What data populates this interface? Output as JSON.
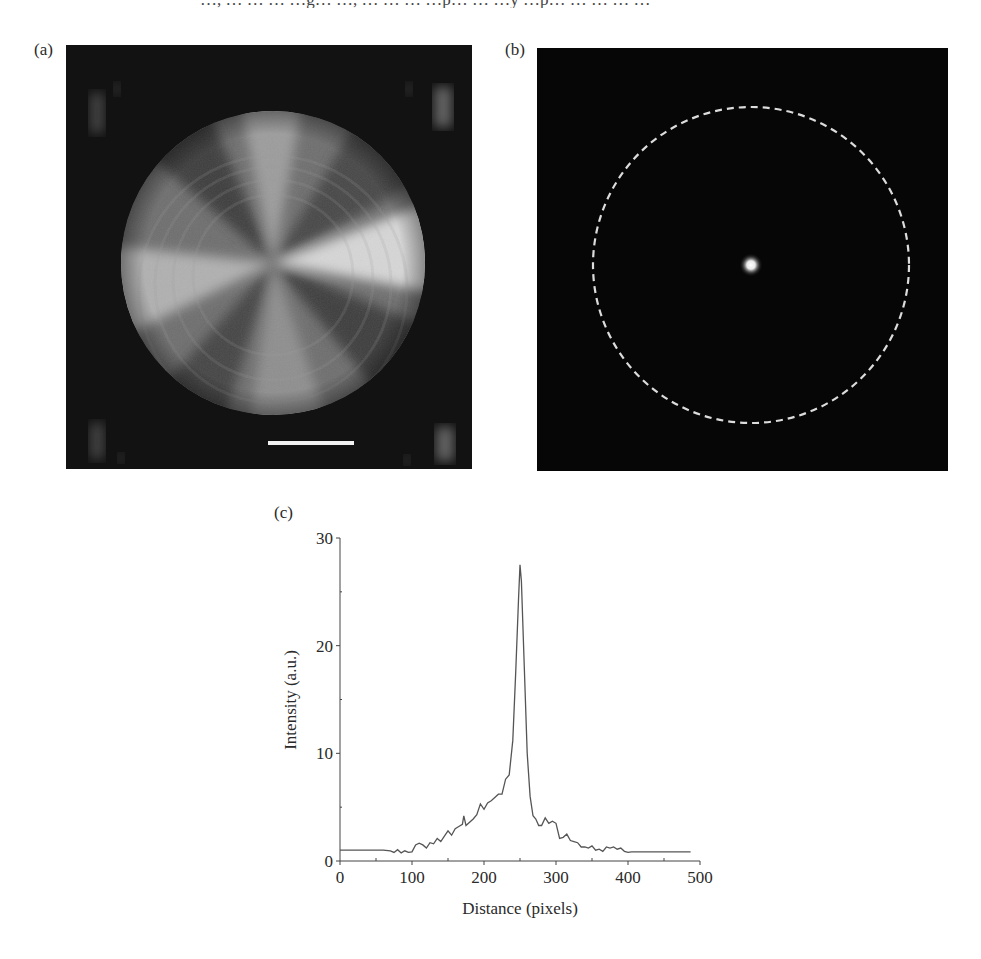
{
  "figure": {
    "top_text_fragment": "…, … … … …g… …, … … … …p… … …y …p… … … … …",
    "panels": [
      {
        "label": "(a)",
        "description": "Conoscopic / polarized image of circular domain with four-lobe radial pattern and scale bar"
      },
      {
        "label": "(b)",
        "description": "Far-field spot image with dashed circle outline and bright central spot"
      },
      {
        "label": "(c)",
        "description": "Intensity line profile"
      }
    ]
  },
  "chart_data": {
    "type": "line",
    "title": "",
    "panel_label": "(c)",
    "xlabel": "Distance (pixels)",
    "ylabel": "Intensity (a.u.)",
    "xlim": [
      0,
      500
    ],
    "ylim": [
      0,
      30
    ],
    "xticks": [
      0,
      100,
      200,
      300,
      400,
      500
    ],
    "yticks": [
      0,
      10,
      20,
      30
    ],
    "grid": false,
    "legend": null,
    "series": [
      {
        "name": "Intensity profile",
        "x": [
          0,
          20,
          40,
          60,
          70,
          75,
          80,
          85,
          90,
          95,
          100,
          105,
          110,
          115,
          120,
          125,
          130,
          135,
          140,
          145,
          150,
          155,
          160,
          165,
          170,
          172,
          175,
          180,
          185,
          190,
          195,
          200,
          205,
          210,
          215,
          220,
          225,
          230,
          235,
          240,
          244,
          248,
          250,
          252,
          256,
          260,
          264,
          268,
          272,
          276,
          280,
          285,
          290,
          295,
          300,
          305,
          310,
          315,
          320,
          325,
          330,
          335,
          340,
          345,
          350,
          355,
          360,
          365,
          370,
          375,
          380,
          385,
          390,
          395,
          400,
          405,
          410,
          420,
          440,
          460,
          487
        ],
        "y": [
          1.0,
          1.0,
          1.0,
          1.0,
          0.95,
          0.8,
          1.05,
          0.75,
          0.95,
          0.8,
          0.85,
          1.5,
          1.65,
          1.5,
          1.2,
          1.7,
          1.6,
          2.1,
          1.8,
          2.3,
          2.8,
          2.4,
          3.0,
          3.2,
          3.4,
          4.2,
          3.3,
          3.6,
          3.9,
          4.3,
          5.3,
          4.8,
          5.4,
          5.6,
          5.9,
          6.2,
          6.2,
          7.6,
          8.0,
          11.2,
          17.5,
          24.5,
          27.5,
          26.0,
          18.0,
          10.0,
          6.0,
          4.2,
          3.9,
          3.3,
          3.3,
          4.0,
          3.5,
          3.7,
          3.5,
          2.1,
          2.2,
          2.5,
          1.9,
          1.8,
          1.7,
          1.3,
          1.3,
          1.2,
          1.4,
          1.0,
          1.1,
          0.9,
          1.3,
          1.2,
          1.3,
          1.1,
          1.2,
          0.9,
          0.8,
          0.85,
          0.85,
          0.85,
          0.85,
          0.85,
          0.85
        ]
      }
    ],
    "peak": {
      "x": 250,
      "y": 27.5
    }
  },
  "colors": {
    "background": "#ffffff",
    "image_background": "#0d0d0d",
    "curve": "#555555",
    "axis": "#444444",
    "text": "#2a2a2a",
    "dashed_circle": "#dcdcdc"
  }
}
